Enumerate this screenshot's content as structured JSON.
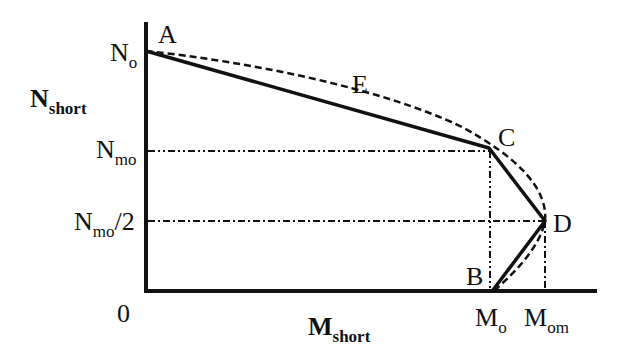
{
  "diagram": {
    "type": "interaction-diagram",
    "axes": {
      "y_label": {
        "main": "N",
        "sub": "short"
      },
      "x_label": {
        "main": "M",
        "sub": "short"
      },
      "origin": "0"
    },
    "y_ticks": [
      {
        "main": "N",
        "sub": "o",
        "suffix": ""
      },
      {
        "main": "N",
        "sub": "mo",
        "suffix": ""
      },
      {
        "main": "N",
        "sub": "mo",
        "suffix": "/2"
      }
    ],
    "x_ticks": [
      {
        "main": "M",
        "sub": "o"
      },
      {
        "main": "M",
        "sub": "om"
      }
    ],
    "points": {
      "A": "A",
      "B": "B",
      "C": "C",
      "D": "D",
      "E": "E"
    },
    "series": [
      {
        "name": "simplified (solid)",
        "style": "solid",
        "points": [
          "A",
          "C",
          "D",
          "B"
        ]
      },
      {
        "name": "exact curve (dashed)",
        "style": "dashed",
        "points": [
          "A",
          "E",
          "C",
          "D",
          "B"
        ]
      }
    ],
    "colors": {
      "ink": "#111111",
      "background": "#ffffff"
    }
  }
}
